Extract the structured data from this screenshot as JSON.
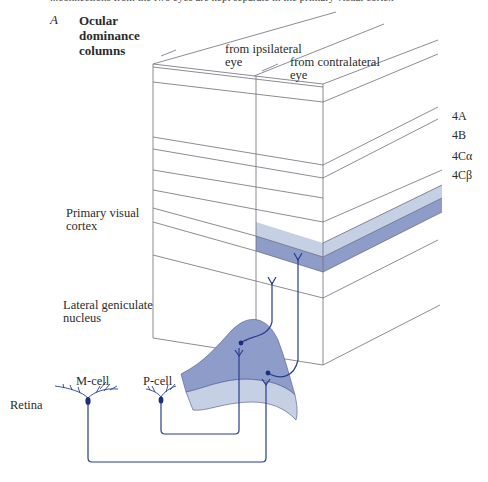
{
  "figure": {
    "panel_letter": "A",
    "panel_title": "Ocular dominance columns",
    "top_cut_text": "...connections from the two eyes are kept separate in the primary visual cortex"
  },
  "column_labels": {
    "ipsilateral_line1": "from ipsilateral",
    "ipsilateral_line2": "eye",
    "contralateral_line1": "from contralateral",
    "contralateral_line2": "eye"
  },
  "layer_labels": [
    "4A",
    "4B",
    "4Cα",
    "4Cβ"
  ],
  "region_labels": {
    "cortex_line1": "Primary visual",
    "cortex_line2": "cortex",
    "lgn_line1": "Lateral geniculate",
    "lgn_line2": "nucleus",
    "retina": "Retina"
  },
  "cell_labels": {
    "m_cell": "M-cell",
    "p_cell": "P-cell"
  },
  "colors": {
    "line": "#6f6f7a",
    "axon": "#2a3d8f",
    "layer_4c_alpha": "#c6d0e4",
    "layer_4c_beta": "#8e9cc9",
    "lgn_dark": "#8e9cc9",
    "lgn_light": "#c6d0e4",
    "text": "#2b2b2b"
  }
}
